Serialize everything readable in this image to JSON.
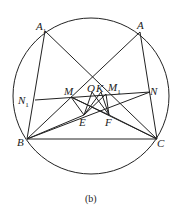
{
  "figure": {
    "caption": "(b)",
    "points": {
      "A1": {
        "name": "A",
        "sub": "1"
      },
      "A": {
        "name": "A",
        "sub": ""
      },
      "B": {
        "name": "B",
        "sub": ""
      },
      "C": {
        "name": "C",
        "sub": ""
      },
      "N1": {
        "name": "N",
        "sub": "1"
      },
      "N": {
        "name": "N",
        "sub": ""
      },
      "M": {
        "name": "M",
        "sub": ""
      },
      "O": {
        "name": "O",
        "sub": ""
      },
      "K": {
        "name": "K",
        "sub": ""
      },
      "M1": {
        "name": "M",
        "sub": "1"
      },
      "E": {
        "name": "E",
        "sub": ""
      },
      "F": {
        "name": "F",
        "sub": ""
      }
    },
    "segments": [
      [
        "A1",
        "B"
      ],
      [
        "A1",
        "C"
      ],
      [
        "A",
        "B"
      ],
      [
        "A",
        "C"
      ],
      [
        "B",
        "C"
      ],
      [
        "N1",
        "N"
      ],
      [
        "B",
        "N"
      ],
      [
        "C",
        "M"
      ],
      [
        "M",
        "E"
      ],
      [
        "M",
        "F"
      ],
      [
        "O",
        "E"
      ],
      [
        "O",
        "F"
      ],
      [
        "K",
        "E"
      ],
      [
        "K",
        "F"
      ],
      [
        "M1",
        "E"
      ],
      [
        "M1",
        "F"
      ],
      [
        "B",
        "E"
      ],
      [
        "C",
        "F"
      ]
    ]
  }
}
